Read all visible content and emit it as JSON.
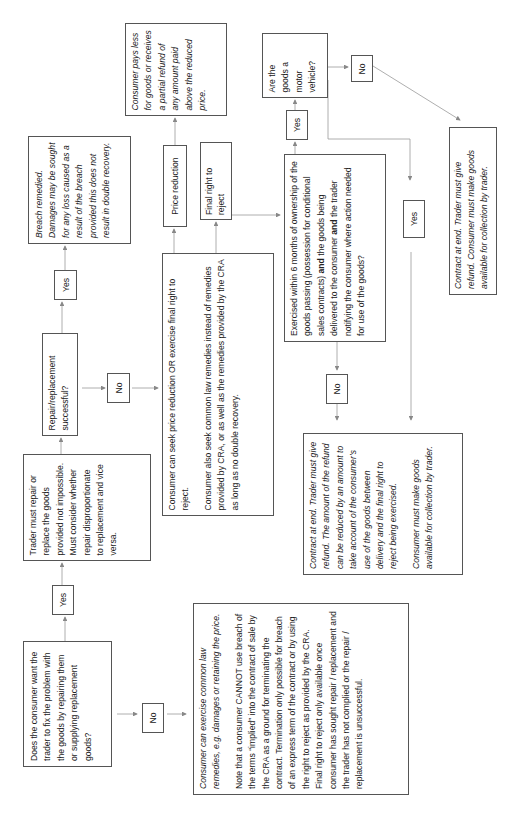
{
  "diagram": {
    "orientation": "rotated -90 degrees (text reads bottom-to-top)",
    "nodes": {
      "start_question": "Does the consumer want the trader to fix the problem with the goods by repairing them or supplying replacement goods?",
      "start_yes": "Yes",
      "start_no": "No",
      "trader_must_repair": "Trader must repair or replace the goods provided not impossible. Must consider whether repair disproportionate to replacement and vice versa.",
      "repair_successful_question": "Repair/replacement successful?",
      "repair_yes": "Yes",
      "repair_no": "No",
      "breach_remedied": "Breach remedied. Damages may be sought for any loss caused as a result of the breach provided this does not result in double recovery.",
      "seek_price_reduction_p1": "Consumer can seek price reduction OR exercise final right to reject.",
      "seek_price_reduction_p2": "Consumer also seek common law remedies instead of remedies provided by CRA, or as well as the remedies provided by the CRA as long as no double recovery.",
      "price_reduction": "Price reduction",
      "final_right_to_reject": "Final right to reject",
      "consumer_pays_less": "Consumer pays less for goods or receives a partial refund of any amount paid above the reduced price.",
      "six_months_question_pre": "Exercised within 6 months of ownership of the goods passing  (possession for conditional sales contracts) ",
      "six_months_question_and1": "and",
      "six_months_question_mid": " the goods being delivered to the consumer ",
      "six_months_question_and2": "and",
      "six_months_question_post": " the trader notifying the consumer where action needed for use of the goods?",
      "six_months_yes": "Yes",
      "six_months_no": "No",
      "motor_vehicle_question": "Are the goods a motor vehicle?",
      "motor_no": "No",
      "motor_yes": "Yes",
      "contract_end_full_refund": "Contract at end. Trader must give refund. Consumer must make goods available for collection by trader.",
      "contract_end_reduced_refund_p1": "Contract at end. Trader must give refund. The amount of the refund can be reduced by an amount to take account of the consumer’s use of the goods between delivery and the final right to reject being exercised.",
      "contract_end_reduced_refund_p2": "Consumer must make goods available for collection by trader.",
      "common_law_p1": "Consumer can exercise common law remedies, e.g. damages or retaining the price.",
      "common_law_p2": "Note that a consumer CANNOT use breach of the terms “implied” into the contract of sale by the CRA as a ground for terminating the contract. Termination only possible for breach of an express term of the contract or by using the right to reject as provided by the CRA. Final right to reject only available once consumer has sought repair / replacement and the trader has not complied or the repair / replacement is unsuccessful."
    },
    "colors": {
      "border": "#555555",
      "connector": "#888888",
      "text": "#222222",
      "background": "#ffffff"
    }
  }
}
